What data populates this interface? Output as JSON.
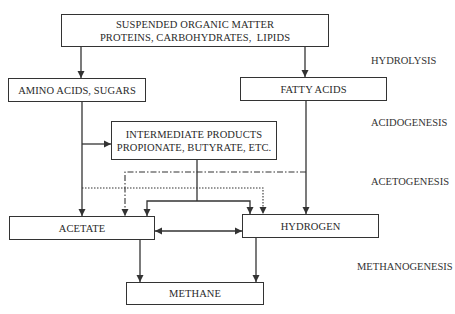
{
  "diagram": {
    "type": "flowchart",
    "nodes": {
      "suspended": {
        "line1": "SUSPENDED ORGANIC MATTER",
        "line2": "PROTEINS, CARBOHYDRATES,  LIPIDS"
      },
      "amino": {
        "label": "AMINO ACIDS, SUGARS"
      },
      "fatty": {
        "label": "FATTY ACIDS"
      },
      "intermediate": {
        "line1": "INTERMEDIATE PRODUCTS",
        "line2": "PROPIONATE, BUTYRATE, ETC."
      },
      "acetate": {
        "label": "ACETATE"
      },
      "hydrogen": {
        "label": "HYDROGEN"
      },
      "methane": {
        "label": "METHANE"
      }
    },
    "stages": {
      "hydrolysis": "HYDROLYSIS",
      "acidogenesis": "ACIDOGENESIS",
      "acetogenesis": "ACETOGENESIS",
      "methanogenesis": "METHANOGENESIS"
    },
    "edges": [
      {
        "from": "suspended",
        "to": "amino",
        "style": "solid"
      },
      {
        "from": "suspended",
        "to": "fatty",
        "style": "solid"
      },
      {
        "from": "amino",
        "to": "intermediate",
        "style": "solid"
      },
      {
        "from": "amino",
        "to": "acetate",
        "style": "solid"
      },
      {
        "from": "amino",
        "to": "hydrogen",
        "style": "dotted"
      },
      {
        "from": "fatty",
        "to": "hydrogen",
        "style": "solid"
      },
      {
        "from": "fatty",
        "to": "acetate",
        "style": "dash-dot"
      },
      {
        "from": "intermediate",
        "to": "acetate",
        "style": "solid"
      },
      {
        "from": "intermediate",
        "to": "hydrogen",
        "style": "solid"
      },
      {
        "from": "acetate",
        "to": "hydrogen",
        "style": "solid-bidirectional"
      },
      {
        "from": "acetate",
        "to": "methane",
        "style": "solid"
      },
      {
        "from": "hydrogen",
        "to": "methane",
        "style": "solid"
      }
    ],
    "colors": {
      "line": "#333333",
      "background": "#ffffff"
    }
  }
}
